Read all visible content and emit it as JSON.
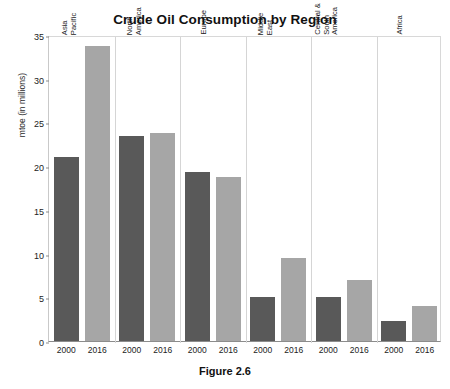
{
  "chart_data": {
    "type": "bar",
    "title": "Crude Oil Consumption by Region",
    "xlabel": "",
    "ylabel": "mtoe (in millions)",
    "ylim": [
      0,
      35
    ],
    "yticks": [
      0,
      5,
      10,
      15,
      20,
      25,
      30,
      35
    ],
    "grid": false,
    "legend": "none",
    "categories": [
      "Asia Pacific",
      "North America",
      "Europe",
      "Middle East",
      "Central & South America",
      "Africa"
    ],
    "series": [
      {
        "name": "2000",
        "color": "#595959",
        "values": [
          21.0,
          23.5,
          19.3,
          5.0,
          5.0,
          2.3
        ]
      },
      {
        "name": "2016",
        "color": "#a6a6a6",
        "values": [
          33.8,
          23.8,
          18.8,
          9.5,
          7.0,
          4.0
        ]
      }
    ],
    "xtick_labels": [
      "2000",
      "2016",
      "2000",
      "2016",
      "2000",
      "2016",
      "2000",
      "2016",
      "2000",
      "2016",
      "2000",
      "2016"
    ]
  },
  "caption": "Figure 2.6",
  "colors": {
    "bar_2000": "#595959",
    "bar_2016": "#a6a6a6",
    "axis": "#8c8c8c",
    "separator": "#d5d5d5",
    "text": "#1a1a1a"
  }
}
